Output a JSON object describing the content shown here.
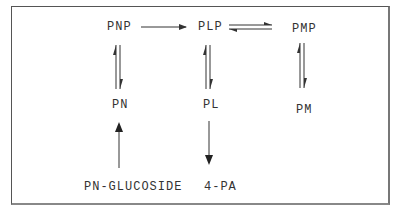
{
  "diagram": {
    "nodes": {
      "pnp": "PNP",
      "plp": "PLP",
      "pmp": "PMP",
      "pn": "PN",
      "pl": "PL",
      "pm": "PM",
      "pn_glucoside": "PN-GLUCOSIDE",
      "four_pa": "4-PA"
    },
    "edges": [
      {
        "from": "PNP",
        "to": "PLP",
        "type": "forward"
      },
      {
        "from": "PLP",
        "to": "PMP",
        "type": "reversible"
      },
      {
        "from": "PNP",
        "to": "PN",
        "type": "reversible"
      },
      {
        "from": "PLP",
        "to": "PL",
        "type": "reversible"
      },
      {
        "from": "PMP",
        "to": "PM",
        "type": "reversible"
      },
      {
        "from": "PN-GLUCOSIDE",
        "to": "PN",
        "type": "forward"
      },
      {
        "from": "PL",
        "to": "4-PA",
        "type": "forward"
      }
    ],
    "colors": {
      "line": "#333333",
      "text": "#333333",
      "border": "#555555"
    }
  }
}
